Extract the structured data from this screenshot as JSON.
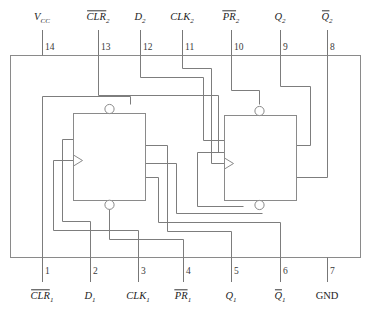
{
  "diagram": {
    "package": {
      "pin_count": 14,
      "outline_color": "#8a8a8a"
    },
    "wire_color": "#7d7d7d",
    "top_pins": [
      {
        "number": "14",
        "label": "V",
        "sub": "CC",
        "italic": true,
        "overline": false,
        "x": 42
      },
      {
        "number": "13",
        "label": "CLR",
        "sub": "2",
        "italic": true,
        "overline": true,
        "x": 98
      },
      {
        "number": "12",
        "label": "D",
        "sub": "2",
        "italic": true,
        "overline": false,
        "x": 140
      },
      {
        "number": "11",
        "label": "CLK",
        "sub": "2",
        "italic": true,
        "overline": false,
        "x": 182
      },
      {
        "number": "10",
        "label": "PR",
        "sub": "2",
        "italic": true,
        "overline": true,
        "x": 231
      },
      {
        "number": "9",
        "label": "Q",
        "sub": "2",
        "italic": true,
        "overline": false,
        "x": 280
      },
      {
        "number": "8",
        "label": "Q",
        "sub": "2",
        "italic": true,
        "overline": true,
        "x": 327
      }
    ],
    "bottom_pins": [
      {
        "number": "1",
        "label": "CLR",
        "sub": "1",
        "italic": true,
        "overline": true,
        "x": 42
      },
      {
        "number": "2",
        "label": "D",
        "sub": "1",
        "italic": true,
        "overline": false,
        "x": 90
      },
      {
        "number": "3",
        "label": "CLK",
        "sub": "1",
        "italic": true,
        "overline": false,
        "x": 138
      },
      {
        "number": "4",
        "label": "PR",
        "sub": "1",
        "italic": true,
        "overline": true,
        "x": 183
      },
      {
        "number": "5",
        "label": "Q",
        "sub": "1",
        "italic": true,
        "overline": false,
        "x": 231
      },
      {
        "number": "6",
        "label": "Q",
        "sub": "1",
        "italic": true,
        "overline": true,
        "x": 280
      },
      {
        "number": "7",
        "label": "GND",
        "sub": "",
        "italic": false,
        "overline": false,
        "x": 327
      }
    ],
    "flipflops": [
      {
        "name": "flip-flop-1",
        "x": 73,
        "y": 113,
        "w": 72,
        "h": 87
      },
      {
        "name": "flip-flop-2",
        "x": 224,
        "y": 115,
        "w": 72,
        "h": 85
      }
    ]
  }
}
